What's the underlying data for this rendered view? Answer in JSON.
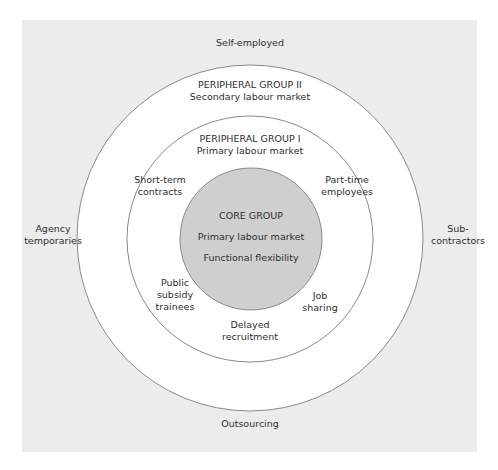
{
  "diagram": {
    "colors": {
      "background_panel": "#ececec",
      "outer_ring_fill": "#ffffff",
      "middle_ring_fill": "#ffffff",
      "core_fill": "#cfcfcf",
      "stroke": "#8a8a8a"
    },
    "outside_labels": {
      "top": "Self-employed",
      "bottom": "Outsourcing",
      "left": "Agency\ntemporaries",
      "right": "Sub-\ncontractors"
    },
    "outer_ring": {
      "title": "PERIPHERAL GROUP II",
      "subtitle": "Secondary labour market"
    },
    "middle_ring": {
      "title": "PERIPHERAL GROUP I",
      "subtitle": "Primary labour market",
      "items": {
        "top_left": "Short-term\ncontracts",
        "top_right": "Part-time\nemployees",
        "bottom_left": "Public\nsubsidy\ntrainees",
        "bottom_right": "Job\nsharing",
        "bottom": "Delayed\nrecruitment"
      }
    },
    "core": {
      "title": "CORE GROUP",
      "line1": "Primary labour market",
      "line2": "Functional flexibility"
    }
  }
}
